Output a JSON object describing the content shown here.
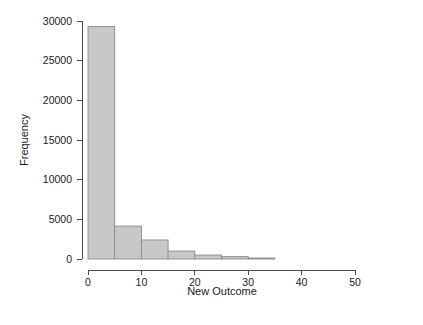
{
  "chart_data": {
    "type": "bar",
    "title": "",
    "subtitle": "",
    "xlabel": "New Outcome",
    "ylabel": "Frequency",
    "xlim": [
      0,
      57
    ],
    "ylim": [
      0,
      30000
    ],
    "grid": false,
    "legend": null,
    "bin_width": 5,
    "bin_edges": [
      0,
      5,
      10,
      15,
      20,
      25,
      30,
      35
    ],
    "categories": [
      "0-5",
      "5-10",
      "10-15",
      "15-20",
      "20-25",
      "25-30",
      "30-35"
    ],
    "values": [
      29300,
      4150,
      2400,
      1000,
      500,
      300,
      120
    ],
    "bar_fill": "#c8c8c8",
    "bar_stroke": "#8c8c8c",
    "xticks": [
      0,
      10,
      20,
      30,
      40,
      50
    ],
    "xtick_labels": [
      "0",
      "10",
      "20",
      "30",
      "40",
      "50"
    ],
    "yticks": [
      0,
      5000,
      10000,
      15000,
      20000,
      25000,
      30000
    ],
    "ytick_labels": [
      "0",
      "5000",
      "10000",
      "15000",
      "20000",
      "25000",
      "30000"
    ],
    "axis_color": "#4d4d4d",
    "text_color": "#1a1a1a"
  },
  "labels": {
    "y_axis_title": "Frequency",
    "x_axis_title": "New Outcome",
    "ytick_0": "0",
    "ytick_5000": "5000",
    "ytick_10000": "10000",
    "ytick_15000": "15000",
    "ytick_20000": "20000",
    "ytick_25000": "25000",
    "ytick_30000": "30000",
    "xtick_0": "0",
    "xtick_10": "10",
    "xtick_20": "20",
    "xtick_30": "30",
    "xtick_40": "40",
    "xtick_50": "50"
  }
}
